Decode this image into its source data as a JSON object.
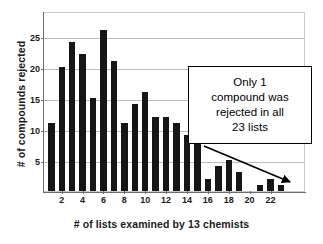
{
  "chart_data": {
    "type": "bar",
    "title": "",
    "xlabel": "# of lists examined by 13 chemists",
    "ylabel": "# of compounds rejected",
    "categories": [
      1,
      2,
      3,
      4,
      5,
      6,
      7,
      8,
      9,
      10,
      11,
      12,
      13,
      14,
      15,
      16,
      17,
      18,
      19,
      20,
      21,
      22,
      23
    ],
    "values": [
      11,
      20,
      24,
      22,
      15,
      26,
      21,
      11,
      14,
      16,
      12,
      12,
      11,
      9,
      8,
      2,
      4,
      5,
      3,
      0,
      1,
      2,
      1
    ],
    "xticks": [
      2,
      4,
      6,
      8,
      10,
      12,
      14,
      16,
      18,
      20,
      22
    ],
    "yticks": [
      5,
      10,
      15,
      20,
      25
    ],
    "ylim": [
      0,
      29
    ],
    "xlim": [
      0.3,
      25.4
    ],
    "grid": "horizontal",
    "legend": "none",
    "bar_color": "#161616",
    "grid_color": "#bdbdbd",
    "axis_color": "#6d6d6d",
    "annotations": [
      {
        "text": "Only 1 compound was rejected in all 23 lists",
        "lines": [
          "Only 1",
          "compound was",
          "rejected in all",
          "23 lists"
        ],
        "points_to_category": 23,
        "points_to_value": 1
      }
    ]
  },
  "figure": {
    "ylabel": "# of compounds rejected",
    "xlabel": "# of lists examined by 13 chemists"
  }
}
